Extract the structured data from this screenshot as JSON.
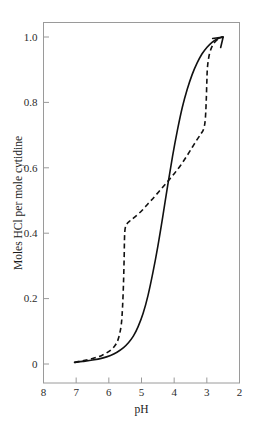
{
  "chart_data": {
    "type": "line",
    "title": "",
    "subtitle": "",
    "xlabel": "pH",
    "ylabel": "Moles HCl per mole cytidine",
    "xlim": [
      8,
      2
    ],
    "ylim": [
      0,
      1.05
    ],
    "x_axis_reversed": true,
    "grid": false,
    "legend": "none",
    "annotations": [
      {
        "type": "arrowhead",
        "at_x": 2.5,
        "at_y": 1.0,
        "direction": "up-right",
        "description": "arrowhead at convergence of both curves"
      }
    ],
    "xticks": [
      8,
      7,
      6,
      5,
      4,
      3,
      2
    ],
    "xtick_labels": [
      "8",
      "7",
      "6",
      "5",
      "4",
      "3",
      "2"
    ],
    "yticks": [
      0,
      0.2,
      0.4,
      0.6,
      0.8,
      1.0
    ],
    "ytick_labels": [
      "0",
      "0.2",
      "0.4",
      "0.6",
      "0.8",
      "1.0"
    ],
    "series": [
      {
        "name": "forward titration (solid)",
        "style": "solid",
        "color": "#111111",
        "x": [
          7.05,
          6.8,
          6.5,
          6.2,
          5.95,
          5.75,
          5.55,
          5.4,
          5.25,
          5.1,
          4.95,
          4.8,
          4.65,
          4.5,
          4.35,
          4.2,
          4.05,
          3.9,
          3.75,
          3.6,
          3.45,
          3.3,
          3.15,
          3.0,
          2.85,
          2.7,
          2.58,
          2.5
        ],
        "y": [
          0.005,
          0.008,
          0.012,
          0.018,
          0.026,
          0.036,
          0.05,
          0.065,
          0.085,
          0.115,
          0.155,
          0.21,
          0.28,
          0.36,
          0.45,
          0.545,
          0.635,
          0.715,
          0.785,
          0.84,
          0.885,
          0.92,
          0.948,
          0.968,
          0.983,
          0.993,
          0.998,
          1.0
        ]
      },
      {
        "name": "reverse titration (dashed)",
        "style": "dashed",
        "color": "#111111",
        "x": [
          7.05,
          6.8,
          6.5,
          6.2,
          5.95,
          5.8,
          5.7,
          5.62,
          5.58,
          5.55,
          5.53,
          5.52,
          5.5,
          5.45,
          5.35,
          5.2,
          5.0,
          4.8,
          4.6,
          4.4,
          4.2,
          4.0,
          3.8,
          3.6,
          3.45,
          3.3,
          3.18,
          3.1,
          3.05,
          3.02,
          3.0,
          2.98,
          2.92,
          2.82,
          2.7,
          2.58,
          2.5
        ],
        "y": [
          0.005,
          0.01,
          0.017,
          0.027,
          0.042,
          0.058,
          0.08,
          0.12,
          0.175,
          0.25,
          0.33,
          0.385,
          0.415,
          0.428,
          0.438,
          0.45,
          0.468,
          0.49,
          0.512,
          0.535,
          0.558,
          0.582,
          0.608,
          0.638,
          0.662,
          0.686,
          0.704,
          0.718,
          0.745,
          0.8,
          0.862,
          0.908,
          0.948,
          0.975,
          0.99,
          0.998,
          1.0
        ]
      }
    ]
  },
  "axes": {
    "x_title": "pH",
    "y_title": "Moles HCl per mole cytidine"
  }
}
